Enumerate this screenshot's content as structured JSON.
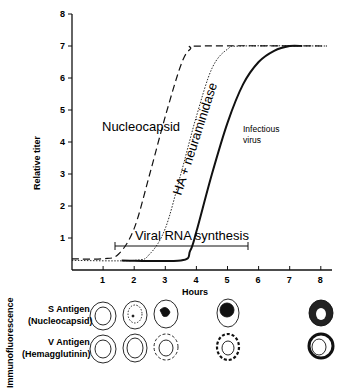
{
  "chart_data": {
    "type": "line",
    "title": "",
    "xlabel": "Hours",
    "ylabel": "Relative titer",
    "xlim": [
      0,
      8
    ],
    "ylim": [
      0,
      8
    ],
    "x_ticks": [
      "1",
      "2",
      "3",
      "4",
      "5",
      "6",
      "7",
      "8"
    ],
    "y_ticks": [
      "1",
      "2",
      "3",
      "4",
      "5",
      "6",
      "7",
      "8"
    ],
    "grid": false,
    "series": [
      {
        "name": "Nucleocapsid",
        "style": "dashed",
        "x": [
          0,
          1,
          1.5,
          2,
          2.5,
          3,
          3.5,
          3.8,
          4.2,
          8.2
        ],
        "y": [
          0.35,
          0.35,
          0.5,
          1.3,
          3.0,
          4.8,
          6.4,
          6.9,
          7.0,
          7.0
        ]
      },
      {
        "name": "HA + neuraminidase",
        "style": "dotted",
        "x": [
          0,
          2,
          2.5,
          3,
          3.5,
          4,
          4.5,
          5,
          5.5,
          8.2
        ],
        "y": [
          0.3,
          0.3,
          0.5,
          1.3,
          3.0,
          4.8,
          6.3,
          6.9,
          7.0,
          7.0
        ]
      },
      {
        "name": "Infectious virus",
        "style": "solid",
        "x": [
          1.6,
          3.5,
          3.8,
          4.0,
          4.5,
          5,
          5.5,
          6,
          6.5,
          7,
          7.4
        ],
        "y": [
          0.3,
          0.3,
          0.6,
          1.2,
          3.0,
          4.6,
          5.8,
          6.5,
          6.85,
          7.0,
          7.0
        ]
      }
    ],
    "annotations": [
      {
        "text": "Viral RNA synthesis",
        "type": "range-bar",
        "x_start": 1.4,
        "x_end": 5.7,
        "y": 1.15
      },
      {
        "text": "Nucleocapsid"
      },
      {
        "text": "HA + neuraminidase"
      },
      {
        "text": "Infectious virus"
      }
    ],
    "immunofluorescence": {
      "section_label": "Immunofluorescence",
      "rows": [
        {
          "label": "S Antigen",
          "sub": "(Nucleocapsid)",
          "times_h": [
            1,
            2,
            3,
            5,
            8
          ]
        },
        {
          "label": "V Antigen",
          "sub": "(Hemagglutinin)",
          "times_h": [
            1,
            2,
            3,
            5,
            8
          ]
        }
      ]
    }
  },
  "labels": {
    "ylabel": "Relative titer",
    "xlabel": "Hours",
    "nucleocapsid": "Nucleocapsid",
    "ha": "HA + neuraminidase",
    "infectious1": "Infectious",
    "infectious2": "virus",
    "rna": "Viral RNA synthesis",
    "immuno": "Immunofluorescence",
    "s_antigen": "S Antigen",
    "s_sub": "(Nucleocapsid)",
    "v_antigen": "V Antigen",
    "v_sub": "(Hemagglutinin)"
  }
}
